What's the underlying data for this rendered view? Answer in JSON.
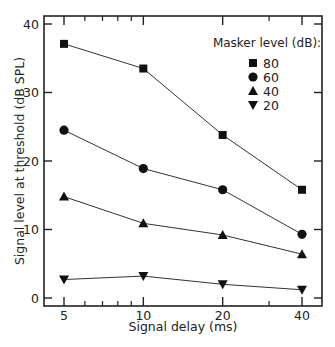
{
  "chart_data": {
    "type": "line",
    "title": "",
    "xlabel": "Signal delay (ms)",
    "ylabel": "Signal level at threshold (dB SPL)",
    "x": [
      5,
      10,
      20,
      40
    ],
    "x_scale": "log",
    "xticks": [
      5,
      10,
      20,
      40
    ],
    "yticks": [
      0,
      10,
      20,
      30,
      40
    ],
    "ylim": [
      -1,
      42
    ],
    "grid": false,
    "legend": {
      "title": "Masker level (dB):",
      "position": "upper right",
      "entries": [
        {
          "label": "80",
          "marker": "square"
        },
        {
          "label": "60",
          "marker": "circle"
        },
        {
          "label": "40",
          "marker": "triangle-up"
        },
        {
          "label": "20",
          "marker": "triangle-down"
        }
      ]
    },
    "series": [
      {
        "name": "80",
        "marker": "square",
        "values": [
          37.1,
          33.5,
          23.8,
          15.8
        ]
      },
      {
        "name": "60",
        "marker": "circle",
        "values": [
          24.5,
          18.9,
          15.8,
          9.3
        ]
      },
      {
        "name": "40",
        "marker": "triangle-up",
        "values": [
          14.8,
          10.9,
          9.2,
          6.4
        ]
      },
      {
        "name": "20",
        "marker": "triangle-down",
        "values": [
          2.7,
          3.2,
          2.0,
          1.2
        ]
      }
    ]
  }
}
